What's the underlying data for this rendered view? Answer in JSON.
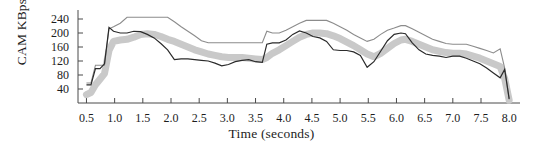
{
  "chart_data": {
    "type": "line",
    "title": "",
    "xlabel": "Time (seconds)",
    "ylabel": "CAM KBps",
    "xlim": [
      0.35,
      8.05
    ],
    "ylim": [
      0,
      260
    ],
    "grid": false,
    "legend": "none",
    "xticks": [
      "0.5",
      "1.0",
      "1.5",
      "2.0",
      "2.5",
      "3.0",
      "3.5",
      "4.0",
      "4.5",
      "5.0",
      "5.5",
      "6.0",
      "6.5",
      "7.0",
      "7.5",
      "8.0"
    ],
    "xtick_values": [
      0.5,
      1.0,
      1.5,
      2.0,
      2.5,
      3.0,
      3.5,
      4.0,
      4.5,
      5.0,
      5.5,
      6.0,
      6.5,
      7.0,
      7.5,
      8.0
    ],
    "yticks": [
      "40",
      "80",
      "120",
      "160",
      "200",
      "240"
    ],
    "ytick_values": [
      40,
      80,
      120,
      160,
      200,
      240
    ],
    "x": [
      0.5,
      0.58,
      0.66,
      0.74,
      0.82,
      0.9,
      0.98,
      1.1,
      1.22,
      1.34,
      1.46,
      1.58,
      1.7,
      1.82,
      1.94,
      2.06,
      2.18,
      2.3,
      2.42,
      2.54,
      2.66,
      2.78,
      2.9,
      3.02,
      3.14,
      3.26,
      3.38,
      3.5,
      3.62,
      3.7,
      3.8,
      3.92,
      4.04,
      4.16,
      4.28,
      4.4,
      4.52,
      4.64,
      4.76,
      4.88,
      5.0,
      5.12,
      5.24,
      5.36,
      5.48,
      5.6,
      5.72,
      5.84,
      5.96,
      6.08,
      6.16,
      6.28,
      6.4,
      6.52,
      6.64,
      6.76,
      6.88,
      7.0,
      7.12,
      7.24,
      7.36,
      7.48,
      7.6,
      7.72,
      7.84,
      7.92,
      8.0
    ],
    "series": [
      {
        "name": "upper-envelope",
        "style": "thin-gray-line",
        "color": "#8c8c8c",
        "width": 1.1,
        "values": [
          57,
          57,
          108,
          108,
          108,
          212,
          218,
          228,
          245,
          245,
          245,
          245,
          245,
          245,
          245,
          232,
          218,
          205,
          192,
          178,
          172,
          172,
          172,
          172,
          172,
          172,
          172,
          172,
          172,
          205,
          200,
          200,
          208,
          218,
          228,
          236,
          236,
          236,
          236,
          228,
          218,
          208,
          196,
          186,
          176,
          182,
          196,
          208,
          214,
          221,
          221,
          212,
          202,
          192,
          182,
          176,
          170,
          168,
          168,
          168,
          162,
          156,
          150,
          143,
          155,
          100,
          10
        ]
      },
      {
        "name": "mid-band",
        "style": "thick-gray-band",
        "color": "#c9c9c9",
        "width": 7,
        "values": [
          24,
          30,
          52,
          68,
          84,
          150,
          176,
          180,
          182,
          188,
          196,
          198,
          196,
          190,
          182,
          176,
          168,
          160,
          152,
          146,
          140,
          136,
          132,
          130,
          130,
          130,
          128,
          126,
          124,
          130,
          142,
          152,
          164,
          176,
          188,
          196,
          200,
          200,
          198,
          192,
          184,
          174,
          164,
          152,
          140,
          132,
          142,
          156,
          170,
          180,
          182,
          176,
          168,
          160,
          152,
          148,
          144,
          142,
          142,
          140,
          134,
          128,
          120,
          112,
          104,
          70,
          8
        ]
      },
      {
        "name": "dark-line",
        "style": "thin-dark-line",
        "color": "#2b2b2b",
        "width": 1.2,
        "values": [
          52,
          52,
          98,
          98,
          112,
          216,
          205,
          200,
          200,
          205,
          204,
          196,
          186,
          170,
          152,
          124,
          126,
          126,
          124,
          122,
          120,
          114,
          106,
          110,
          118,
          122,
          124,
          118,
          116,
          168,
          172,
          172,
          180,
          196,
          206,
          200,
          190,
          186,
          176,
          152,
          150,
          150,
          146,
          136,
          102,
          118,
          148,
          178,
          196,
          200,
          198,
          172,
          152,
          140,
          136,
          134,
          130,
          134,
          134,
          128,
          120,
          112,
          100,
          86,
          72,
          96,
          12
        ]
      }
    ],
    "annotations": []
  },
  "axes": {
    "y_axis_title": "CAM KBps",
    "x_axis_title": "Time (seconds)"
  }
}
